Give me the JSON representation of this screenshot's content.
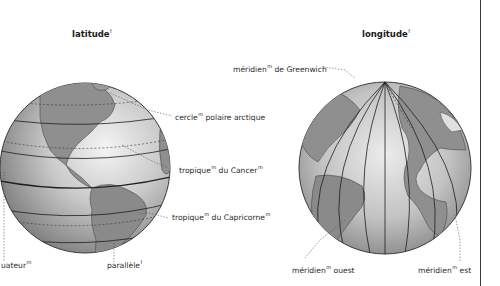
{
  "diagrams": [
    {
      "title": {
        "text": "latitude",
        "gender": "f"
      },
      "labels": [
        {
          "id": "arctic-circle",
          "text": "cercle",
          "gender": "m",
          "rest": " polaire arctique"
        },
        {
          "id": "tropic-cancer",
          "text": "tropique",
          "gender": "m",
          "rest": " du Cancer",
          "gender2": "m"
        },
        {
          "id": "tropic-capricorn",
          "text": "tropique",
          "gender": "m",
          "rest": " du Capricorne",
          "gender2": "m"
        },
        {
          "id": "equator",
          "text": "uateur",
          "gender": "m",
          "rest": ""
        },
        {
          "id": "parallel",
          "text": "parallèle",
          "gender": "f",
          "rest": ""
        }
      ]
    },
    {
      "title": {
        "text": "longitude",
        "gender": "f"
      },
      "labels": [
        {
          "id": "greenwich-meridian",
          "text": "méridien",
          "gender": "m",
          "rest": " de Greenwich"
        },
        {
          "id": "west-meridian",
          "text": "méridien",
          "gender": "m",
          "rest": " ouest"
        },
        {
          "id": "east-meridian",
          "text": "méridien",
          "gender": "m",
          "rest": " est"
        }
      ]
    }
  ],
  "colors": {
    "ocean_light": "#e6e6e6",
    "ocean_dark": "#8c8c8c",
    "land": "#9a9a9a",
    "line": "#1e1e1e",
    "divider": "#3a3a3a"
  }
}
